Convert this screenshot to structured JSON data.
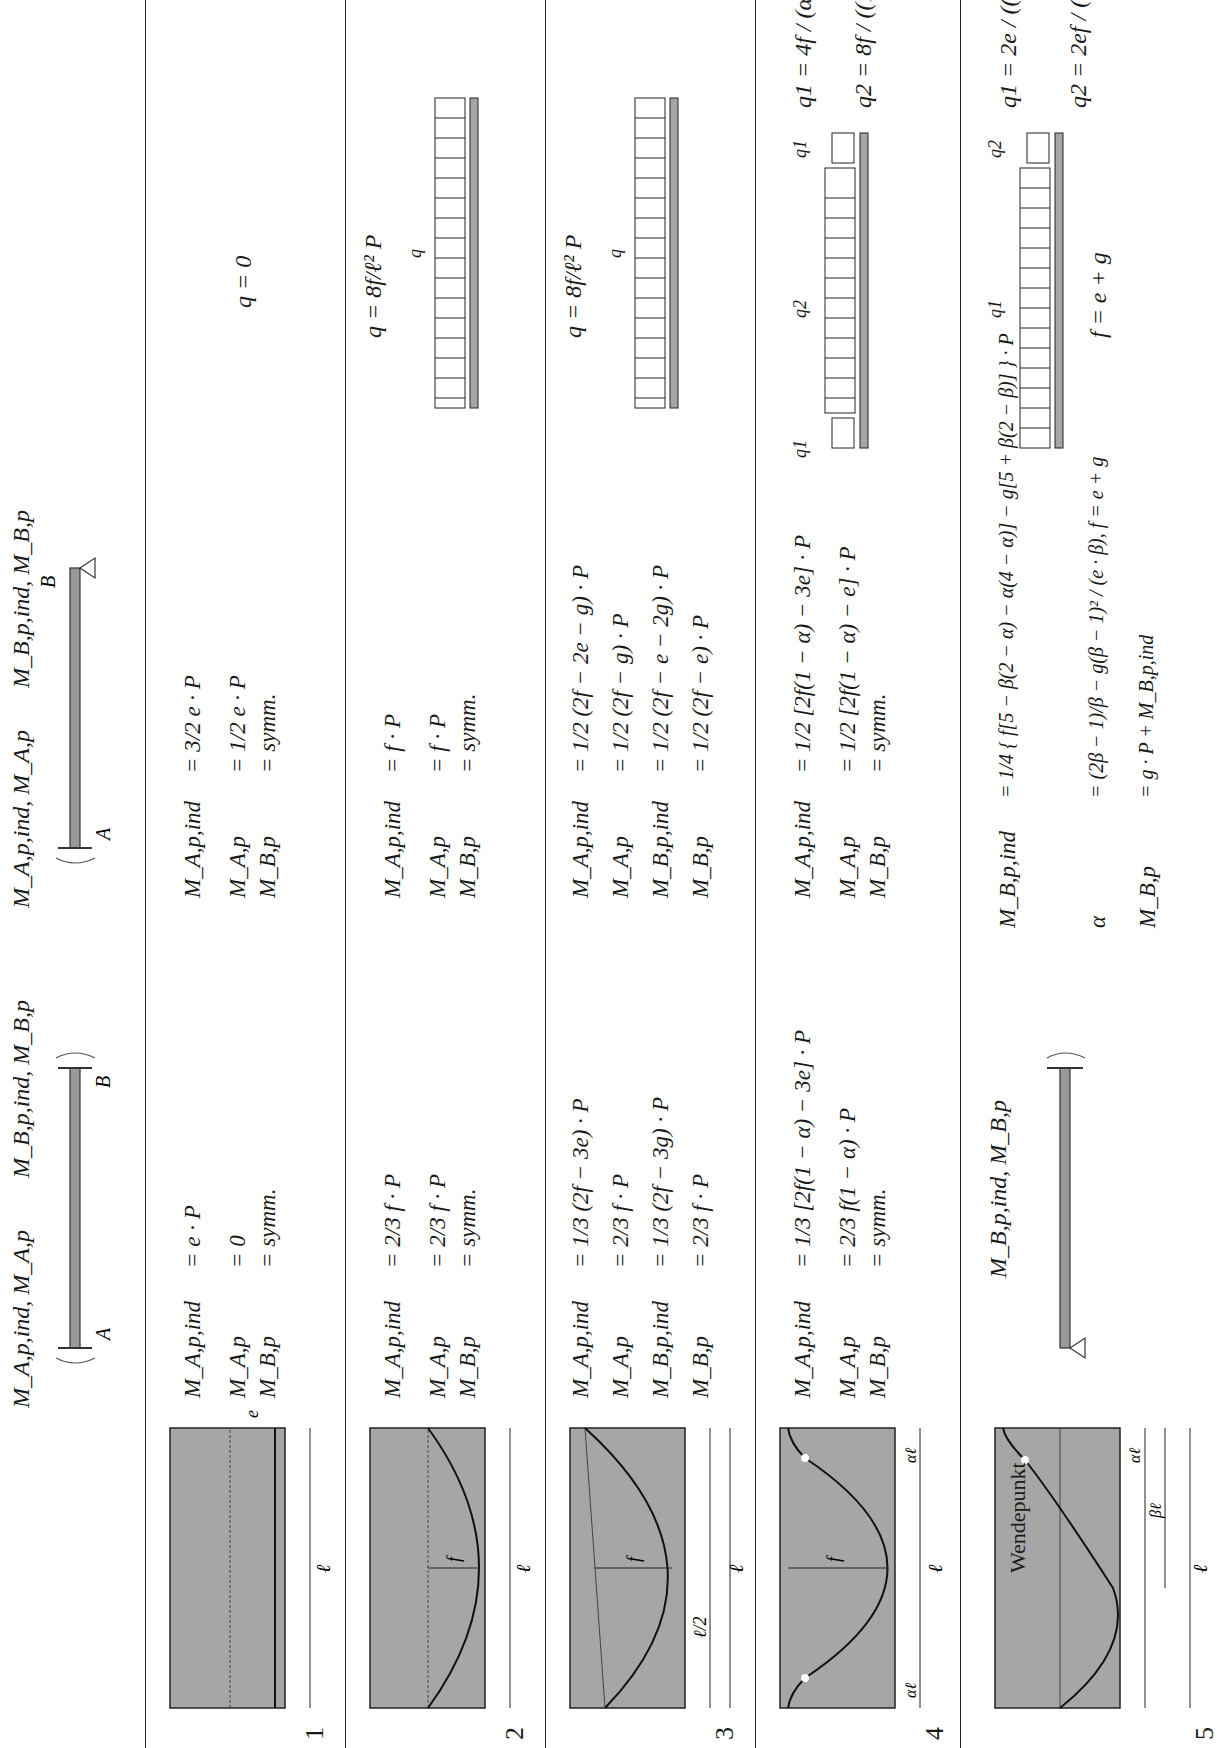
{
  "header": {
    "fixed_fixed": {
      "label_left": "M_A,p,ind, M_A,p",
      "label_right": "M_B,p,ind, M_B,p",
      "support_a": "A",
      "support_b": "B"
    },
    "fixed_pinned_b": {
      "label_left": "M_A,p,ind, M_A,p",
      "label_right": "M_B,p,ind, M_B,p",
      "support_a": "A",
      "support_b": "B"
    }
  },
  "rows": [
    {
      "number": "1",
      "tendon": {
        "type": "straight",
        "labels": [
          "e",
          "ℓ"
        ]
      },
      "fixed_fixed": [
        {
          "lhs": "M_A,p,ind",
          "rhs": "= e · P"
        },
        {
          "lhs": "M_A,p",
          "rhs": "= 0"
        },
        {
          "lhs": "M_B,p",
          "rhs": "= symm."
        }
      ],
      "propped": [
        {
          "lhs": "M_A,p,ind",
          "rhs": "= 3/2 e · P"
        },
        {
          "lhs": "M_A,p",
          "rhs": "= 1/2 e · P"
        },
        {
          "lhs": "M_B,p",
          "rhs": "= symm."
        }
      ],
      "load": {
        "formula": "q = 0"
      }
    },
    {
      "number": "2",
      "tendon": {
        "type": "parabola",
        "labels": [
          "f",
          "ℓ"
        ]
      },
      "fixed_fixed": [
        {
          "lhs": "M_A,p,ind",
          "rhs": "= 2/3 f · P"
        },
        {
          "lhs": "M_A,p",
          "rhs": "= 2/3 f · P"
        },
        {
          "lhs": "M_B,p",
          "rhs": "= symm."
        }
      ],
      "propped": [
        {
          "lhs": "M_A,p,ind",
          "rhs": "= f · P"
        },
        {
          "lhs": "M_A,p",
          "rhs": "= f · P"
        },
        {
          "lhs": "M_B,p",
          "rhs": "= symm."
        }
      ],
      "load": {
        "formula": "q = 8f/ℓ² P",
        "diagram_label": "q"
      }
    },
    {
      "number": "3",
      "tendon": {
        "type": "parabola-eccentric-ends",
        "labels": [
          "e",
          "g",
          "f",
          "ℓ/2",
          "ℓ"
        ]
      },
      "fixed_fixed": [
        {
          "lhs": "M_A,p,ind",
          "rhs": "= 1/3 (2f − 3e) · P"
        },
        {
          "lhs": "M_A,p",
          "rhs": "= 2/3 f · P"
        },
        {
          "lhs": "M_B,p,ind",
          "rhs": "= 1/3 (2f − 3g) · P"
        },
        {
          "lhs": "M_B,p",
          "rhs": "= 2/3 f · P"
        }
      ],
      "propped": [
        {
          "lhs": "M_A,p,ind",
          "rhs": "= 1/2 (2f − 2e − g) · P"
        },
        {
          "lhs": "M_A,p",
          "rhs": "= 1/2 (2f − g) · P"
        },
        {
          "lhs": "M_B,p,ind",
          "rhs": "= 1/2 (2f − e − 2g) · P"
        },
        {
          "lhs": "M_B,p",
          "rhs": "= 1/2 (2f − e) · P"
        }
      ],
      "load": {
        "formula": "q = 8f/ℓ² P",
        "diagram_label": "q"
      }
    },
    {
      "number": "4",
      "tendon": {
        "type": "reverse-parabola-both-ends",
        "labels": [
          "e",
          "f",
          "αℓ",
          "αℓ",
          "ℓ"
        ]
      },
      "fixed_fixed": [
        {
          "lhs": "M_A,p,ind",
          "rhs": "= 1/3 [2f(1 − α) − 3e] · P"
        },
        {
          "lhs": "M_A,p",
          "rhs": "= 2/3 f(1 − α) · P"
        },
        {
          "lhs": "M_B,p",
          "rhs": "= symm."
        }
      ],
      "propped": [
        {
          "lhs": "M_A,p,ind",
          "rhs": "= 1/2 [2f(1 − α) − 3e] · P"
        },
        {
          "lhs": "M_A,p",
          "rhs": "= 1/2 [2f(1 − α) − e] · P"
        },
        {
          "lhs": "M_B,p",
          "rhs": "= symm."
        }
      ],
      "load": {
        "diagram_labels": [
          "q1",
          "q2",
          "q1"
        ],
        "formulas": [
          "q1 = 4f / (α · ℓ²) P",
          "q2 = 8f / ((1 − 2α) · ℓ²) P"
        ]
      }
    },
    {
      "number": "5",
      "tendon": {
        "type": "reverse-parabola-one-end",
        "labels": [
          "e",
          "g",
          "αℓ",
          "βℓ",
          "ℓ"
        ],
        "annotation": "Wendepunkt"
      },
      "cantilever_label": "M_B,p,ind, M_B,p",
      "propped": [
        {
          "lhs": "M_B,p,ind",
          "rhs": "= 1/4 { f[5 − β(2 − α) − α(4 − α)] − g[5 + β(2 − β)] } · P"
        },
        {
          "lhs": "α",
          "rhs": "= (2β − 1)/β − g(β − 1)² / (e · β),  f = e + g"
        },
        {
          "lhs": "M_B,p",
          "rhs": "= g · P + M_B,p,ind"
        }
      ],
      "load": {
        "diagram_labels": [
          "q1",
          "q2"
        ],
        "note": "f = e + g",
        "formulas": [
          "q1 = 2e / ((1 − β)² · ℓ²) P",
          "q2 = 2ef / ((2fβ − gβ² − f) · ℓ²) P"
        ]
      }
    }
  ]
}
